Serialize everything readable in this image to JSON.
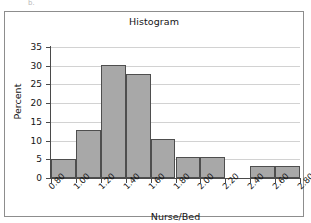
{
  "part_label": "b.",
  "chart_data": {
    "type": "bar",
    "title": "Histogram",
    "xlabel": "Nurse/Bed",
    "ylabel": "Percent",
    "grid": true,
    "legend": "none",
    "xlim": [
      0.8,
      2.8
    ],
    "ylim": [
      0,
      35
    ],
    "bin_width": 0.2,
    "x_tick_labels": [
      "0.80",
      "1.00",
      "1.20",
      "1.40",
      "1.60",
      "1.80",
      "2.00",
      "2.20",
      "2.40",
      "2.60",
      "2.80"
    ],
    "x_tick_values": [
      0.8,
      1.0,
      1.2,
      1.4,
      1.6,
      1.8,
      2.0,
      2.2,
      2.4,
      2.6,
      2.8
    ],
    "y_tick_labels": [
      "0",
      "5",
      "10",
      "15",
      "20",
      "25",
      "30",
      "35"
    ],
    "y_tick_values": [
      0,
      5,
      10,
      15,
      20,
      25,
      30,
      35
    ],
    "categories": [
      "0.80-1.00",
      "1.00-1.20",
      "1.20-1.40",
      "1.40-1.60",
      "1.60-1.80",
      "1.80-2.00",
      "2.00-2.20",
      "2.20-2.40",
      "2.40-2.60",
      "2.60-2.80"
    ],
    "bin_starts": [
      0.8,
      1.0,
      1.2,
      1.4,
      1.6,
      1.8,
      2.0,
      2.2,
      2.4,
      2.6
    ],
    "values": [
      5.1,
      12.8,
      30.1,
      27.9,
      10.4,
      5.5,
      5.5,
      0,
      3.2,
      3.2
    ],
    "bar_fill": "#a8a8a8",
    "bar_edge": "#4e4e4e",
    "grid_color": "#d2d2d2",
    "axis_color": "#4a4a4a"
  }
}
